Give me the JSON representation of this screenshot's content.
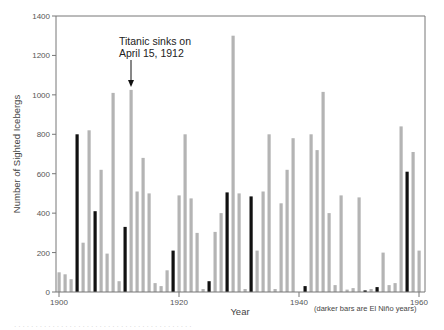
{
  "chart_data": {
    "type": "bar",
    "title": "",
    "xlabel": "Year",
    "ylabel": "Number of Sighted Icebergs",
    "ylim": [
      0,
      1400
    ],
    "xlim": [
      1900,
      1960
    ],
    "yticks": [
      0,
      200,
      400,
      600,
      800,
      1000,
      1200,
      1400
    ],
    "xticks": [
      1900,
      1920,
      1940,
      1960
    ],
    "grid": false,
    "legend": "none",
    "note": "(darker bars are El Niño years)",
    "annotation": {
      "text_line1": "Titanic sinks on",
      "text_line2": "April 15, 1912",
      "year": 1912
    },
    "colors": {
      "normal": "#b4b4b4",
      "el_nino": "#111111",
      "axis": "#777777"
    },
    "categories": [
      1900,
      1901,
      1902,
      1903,
      1904,
      1905,
      1906,
      1907,
      1908,
      1909,
      1910,
      1911,
      1912,
      1913,
      1914,
      1915,
      1916,
      1917,
      1918,
      1919,
      1920,
      1921,
      1922,
      1923,
      1924,
      1925,
      1926,
      1927,
      1928,
      1929,
      1930,
      1931,
      1932,
      1933,
      1934,
      1935,
      1936,
      1937,
      1938,
      1939,
      1940,
      1941,
      1942,
      1943,
      1944,
      1945,
      1946,
      1947,
      1948,
      1949,
      1950,
      1951,
      1952,
      1953,
      1954,
      1955,
      1956,
      1957,
      1958,
      1959,
      1960
    ],
    "values": [
      100,
      90,
      65,
      800,
      250,
      820,
      410,
      620,
      195,
      1010,
      55,
      330,
      1025,
      510,
      680,
      500,
      45,
      30,
      110,
      210,
      490,
      800,
      475,
      300,
      15,
      55,
      305,
      400,
      505,
      1300,
      500,
      15,
      485,
      210,
      510,
      800,
      15,
      450,
      620,
      780,
      0,
      30,
      800,
      720,
      1015,
      400,
      35,
      490,
      12,
      20,
      480,
      8,
      15,
      25,
      200,
      35,
      45,
      840,
      610,
      710,
      210
    ],
    "el_nino_years": [
      1903,
      1906,
      1911,
      1919,
      1925,
      1928,
      1932,
      1941,
      1951,
      1953,
      1958
    ]
  },
  "labels": {
    "ylabel": "Number of Sighted Icebergs",
    "xlabel": "Year",
    "note": "(darker bars are El Niño years)",
    "annot1": "Titanic sinks on",
    "annot2": "April 15, 1912",
    "caption": "· · · · · · · · · · · · · · · · · · · · · · · · · · · · · · · · · · · · · · · · · ·"
  }
}
